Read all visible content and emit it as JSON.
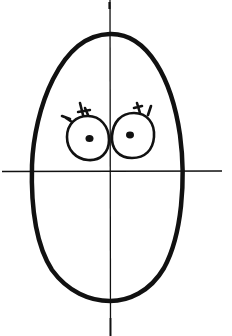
{
  "figure": {
    "title": "Egg-shaped face sketch with construction guidelines",
    "colors": {
      "background": "#ffffff",
      "ink": "#111111"
    },
    "elements": {
      "head": {
        "shape": "oval",
        "cx": 108,
        "cy": 166,
        "rx": 77,
        "ry": 133
      },
      "vertical_guide": {
        "x": 110,
        "y1": 0,
        "y2": 336
      },
      "horizontal_guide": {
        "y": 171,
        "x1": 2,
        "x2": 222
      },
      "left_eye": {
        "cx": 88,
        "cy": 138,
        "rx": 21,
        "ry": 23,
        "pupil": [
          90,
          139
        ]
      },
      "right_eye": {
        "cx": 131,
        "cy": 135,
        "rx": 20,
        "ry": 23,
        "pupil": [
          130,
          135
        ]
      }
    }
  }
}
